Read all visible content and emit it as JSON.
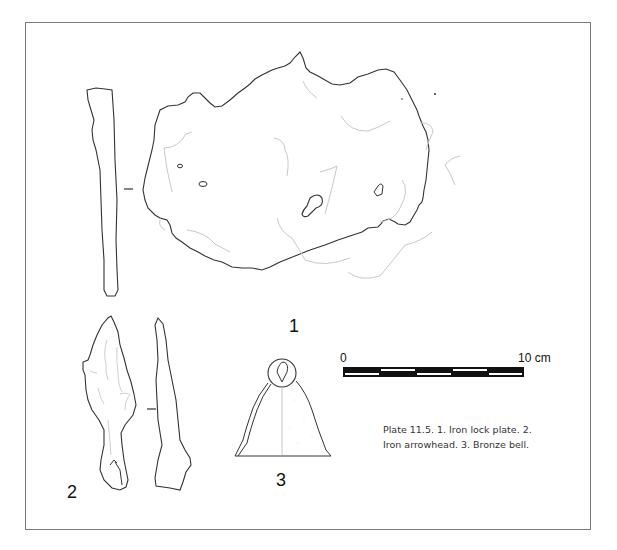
{
  "figure": {
    "labels": {
      "item1": "1",
      "item2": "2",
      "item3": "3"
    },
    "scale_bar": {
      "start_label": "0",
      "end_label": "10 cm",
      "segments": 5
    },
    "caption": "Plate 11.5. 1. Iron lock plate. 2. Iron arrowhead. 3. Bronze bell.",
    "colors": {
      "outline": "#333333",
      "detail": "#c8c8c8",
      "frame": "#7a7a7a"
    }
  }
}
